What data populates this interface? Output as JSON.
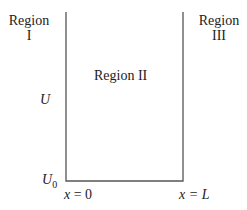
{
  "diagram": {
    "type": "potential-well",
    "regions": [
      {
        "name": "Region I",
        "line1": "Region",
        "line2": "I"
      },
      {
        "name": "Region II",
        "label": "Region II"
      },
      {
        "name": "Region III",
        "line1": "Region",
        "line2": "III"
      }
    ],
    "y_labels": {
      "top": "U",
      "bottom": "U",
      "bottom_sub": "0"
    },
    "x_labels": {
      "left_var": "x",
      "left_eq": " = 0",
      "right_var": "x",
      "right_eq": " = L"
    },
    "colors": {
      "line": "#555555",
      "text": "#222222"
    }
  }
}
